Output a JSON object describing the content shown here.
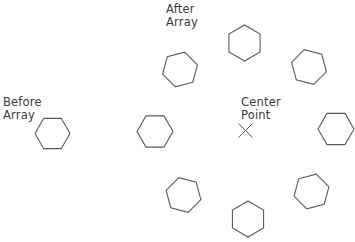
{
  "diagram": {
    "stroke_color": "#5a5a5a",
    "text_color": "#3a3a3a",
    "background": "#ffffff",
    "labels": {
      "before": {
        "line1": "Before",
        "line2": "Array",
        "x": 3,
        "y": 96
      },
      "after": {
        "line1": "After",
        "line2": "Array",
        "x": 166,
        "y": 3
      },
      "center": {
        "line1": "Center",
        "line2": "Point",
        "x": 241,
        "y": 96
      }
    },
    "center_point": {
      "x": 245.5,
      "y": 130.5,
      "size": 7
    },
    "source_hexagon": {
      "name": "before-array-hexagon",
      "cx": 52.5,
      "cy": 133.5,
      "r": 17.5,
      "rotation": 0
    },
    "array_hexagons": [
      {
        "name": "array-hexagon-left",
        "cx": 155,
        "cy": 131.5,
        "r": 18,
        "rotation": 0
      },
      {
        "name": "array-hexagon-upper-left",
        "cx": 180,
        "cy": 69.5,
        "r": 18,
        "rotation": 45
      },
      {
        "name": "array-hexagon-top",
        "cx": 244.5,
        "cy": 43,
        "r": 18,
        "rotation": 90
      },
      {
        "name": "array-hexagon-upper-right",
        "cx": 309,
        "cy": 67,
        "r": 18,
        "rotation": 135
      },
      {
        "name": "array-hexagon-right",
        "cx": 336,
        "cy": 129,
        "r": 18,
        "rotation": 180
      },
      {
        "name": "array-hexagon-lower-right",
        "cx": 311.5,
        "cy": 191.5,
        "r": 18,
        "rotation": 225
      },
      {
        "name": "array-hexagon-bottom",
        "cx": 248,
        "cy": 219,
        "r": 18,
        "rotation": 270
      },
      {
        "name": "array-hexagon-lower-left",
        "cx": 183.5,
        "cy": 195,
        "r": 18,
        "rotation": 315
      }
    ]
  }
}
